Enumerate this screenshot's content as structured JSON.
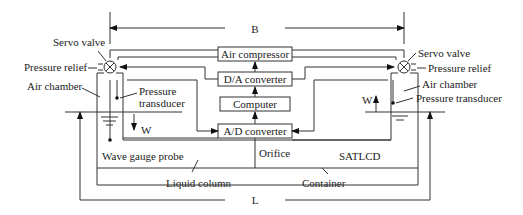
{
  "dimensions": {
    "B": "B",
    "L": "L"
  },
  "blocks": {
    "air_compressor": "Air compressor",
    "da_converter": "D/A converter",
    "computer": "Computer",
    "ad_converter": "A/D converter"
  },
  "left": {
    "servo_valve": "Servo valve",
    "pressure_relief": "Pressure relief",
    "air_chamber": "Air chamber",
    "pressure_transducer_1": "Pressure",
    "pressure_transducer_2": "transducer",
    "w": "W",
    "wave_gauge_probe": "Wave gauge probe"
  },
  "right": {
    "servo_valve": "Servo valve",
    "pressure_relief": "Pressure relief",
    "air_chamber": "Air chamber",
    "pressure_transducer": "Pressure transducer",
    "w": "W"
  },
  "bottom": {
    "orifice": "Orifice",
    "satlcd": "SATLCD",
    "liquid_column": "Liquid column",
    "container": "Container"
  }
}
